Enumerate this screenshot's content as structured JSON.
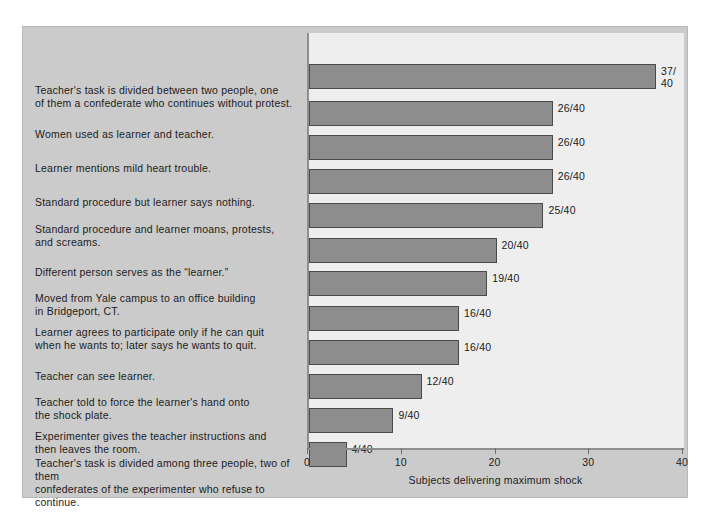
{
  "chart_data": {
    "type": "bar",
    "orientation": "horizontal",
    "title": "",
    "xlabel": "Subjects delivering maximum shock",
    "ylabel": "",
    "xlim": [
      0,
      40
    ],
    "xticks": [
      0,
      10,
      20,
      30,
      40
    ],
    "xtick_labels": [
      "0",
      "10",
      "20",
      "30",
      "40"
    ],
    "grid": false,
    "legend": null,
    "total": 40,
    "categories": [
      "Teacher's task is divided between two people, one\nof them a confederate who continues without protest.",
      "Women used as learner and teacher.",
      "Learner mentions mild heart trouble.",
      "Standard procedure but learner says nothing.",
      "Standard procedure and learner moans, protests,\nand screams.",
      "Different person serves as the “learner.”",
      "Moved from Yale campus to an office building\nin Bridgeport, CT.",
      "Learner agrees to participate only if he can quit\nwhen he wants to; later says he wants to quit.",
      "Teacher can see learner.",
      "Teacher told to force the learner's hand onto\nthe shock plate.",
      "Experimenter gives the teacher instructions and\nthen leaves the room.",
      "Teacher's task is divided among three people, two of them\nconfederates of the experimenter who refuse to continue."
    ],
    "values": [
      37,
      26,
      26,
      26,
      25,
      20,
      19,
      16,
      16,
      12,
      9,
      4
    ],
    "value_labels": [
      "37/\n40",
      "26/40",
      "26/40",
      "26/40",
      "25/40",
      "20/40",
      "19/40",
      "16/40",
      "16/40",
      "12/40",
      "9/40",
      "4/40"
    ]
  },
  "colors": {
    "bar_fill": "#8d8d8d",
    "bar_edge": "#4a4a4a",
    "plot_background": "#eeeeee",
    "figure_background": "#cbcbcb",
    "axis": "#8e8e8e",
    "text": "#1b1b1b"
  }
}
